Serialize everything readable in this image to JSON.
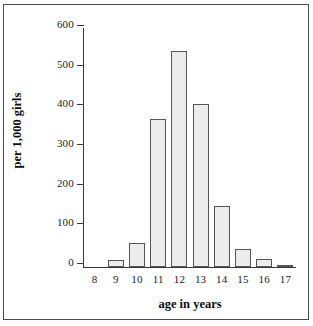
{
  "chart_data": {
    "type": "bar",
    "title": "",
    "xlabel": "age in years",
    "ylabel": "per 1,000 girls",
    "categories": [
      "8",
      "9",
      "10",
      "11",
      "12",
      "13",
      "14",
      "15",
      "16",
      "17"
    ],
    "values": [
      0,
      18,
      60,
      373,
      545,
      410,
      155,
      45,
      20,
      5
    ],
    "series": [
      {
        "name": "per 1,000 girls",
        "values": [
          0,
          18,
          60,
          373,
          545,
          410,
          155,
          45,
          20,
          5
        ]
      }
    ],
    "ylim": [
      0,
      600
    ],
    "yticks": [
      0,
      100,
      200,
      300,
      400,
      500,
      600
    ],
    "ytick_labels": [
      "0",
      "100",
      "200",
      "300",
      "400",
      "500",
      "600"
    ],
    "grid": false,
    "legend": "none",
    "bar_fill_color": "#ececec",
    "bar_border_color": "#555555",
    "axis_color": "#3a3a3a",
    "frame_color": "#4a4a4a",
    "text_color": "#1c1c1c"
  }
}
